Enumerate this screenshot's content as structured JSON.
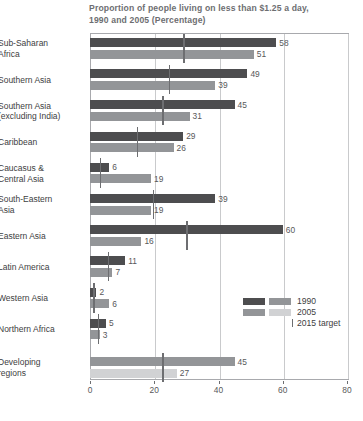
{
  "chart_data": {
    "type": "bar",
    "orientation": "horizontal",
    "title": "Proportion of people living on less than $1.25 a day, 1990 and 2005 (Percentage)",
    "title_line1": "Proportion of people living on less than $1.25 a day,",
    "title_line2": "1990 and 2005 (Percentage)",
    "xlabel": "",
    "ylabel": "",
    "xlim": [
      0,
      80
    ],
    "xticks": [
      0,
      20,
      40,
      60,
      80
    ],
    "xtick_labels": [
      "0",
      "20",
      "40",
      "60",
      "80"
    ],
    "grid": "vertical",
    "legend_position": "inside-lower-right",
    "categories": [
      "Sub-Saharan Africa",
      "Southern Asia",
      "Southern Asia (excluding India)",
      "Caribbean",
      "Caucasus & Central Asia",
      "South-Eastern Asia",
      "Eastern Asia",
      "Latin America",
      "Western Asia",
      "Northern Africa",
      "Developing regions"
    ],
    "category_lines": [
      [
        "Sub-Saharan",
        "Africa"
      ],
      [
        "Southern Asia"
      ],
      [
        "Southern Asia",
        "(excluding India)"
      ],
      [
        "Caribbean"
      ],
      [
        "Caucasus &",
        "Central Asia"
      ],
      [
        "South-Eastern",
        "Asia"
      ],
      [
        "Eastern Asia"
      ],
      [
        "Latin America"
      ],
      [
        "Western Asia"
      ],
      [
        "Northern Africa"
      ],
      [
        "Developing",
        "regions"
      ]
    ],
    "series": [
      {
        "name": "1990",
        "color": "#4d4d4f",
        "values": [
          58,
          49,
          45,
          29,
          6,
          39,
          60,
          11,
          2,
          5,
          45
        ]
      },
      {
        "name": "2005",
        "color": "#939598",
        "values": [
          51,
          39,
          31,
          26,
          19,
          19,
          16,
          7,
          6,
          3,
          27
        ]
      },
      {
        "name": "2015 target",
        "color": "#6d6e71",
        "values": [
          29,
          24.5,
          22.5,
          14.5,
          3,
          19.5,
          30,
          5.5,
          1,
          2.5,
          22.5
        ]
      }
    ],
    "legend": [
      {
        "label": "1990",
        "swatch_a": "#4d4d4f",
        "swatch_b": "#939598"
      },
      {
        "label": "2005",
        "swatch_a": "#939598",
        "swatch_b": "#d1d2d4"
      },
      {
        "label": "2015 target",
        "swatch_a": "",
        "swatch_b": ""
      }
    ],
    "colors": {
      "series_1990": "#4d4d4f",
      "series_2005": "#939598",
      "developing_1990": "#939598",
      "developing_2005": "#d1d2d4",
      "target_tick": "#6d6e71",
      "grid": "#c9cacc",
      "frame": "#a8a9ad",
      "text": "#58585a",
      "background": "#ffffff"
    }
  }
}
